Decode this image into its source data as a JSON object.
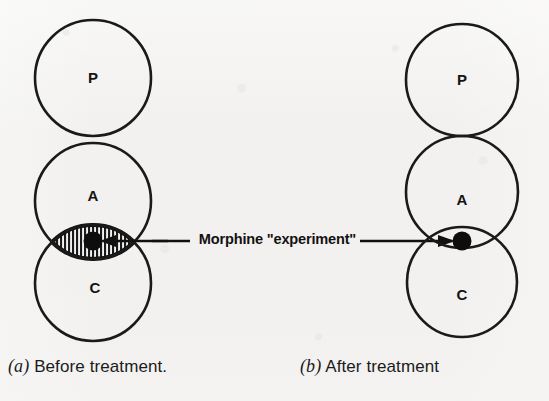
{
  "figure": {
    "center_label": "Morphine \"experiment\"",
    "background_color": "#f2f1ef",
    "ink_color": "#141414"
  },
  "panels": [
    {
      "id": "before",
      "caption_marker": "(a)",
      "caption_text": "Before treatment.",
      "circles": [
        {
          "label": "P",
          "cx": 93,
          "cy": 78,
          "r": 58
        },
        {
          "label": "A",
          "cx": 93,
          "cy": 201,
          "r": 58
        },
        {
          "label": "C",
          "cx": 93,
          "cy": 283,
          "r": 58
        }
      ],
      "overlap": {
        "between": [
          "A",
          "C"
        ],
        "hatched": true,
        "hatch_direction": "vertical",
        "shape": "lens"
      },
      "dot": {
        "cx": 93,
        "cy": 242,
        "r": 9
      },
      "arrow_direction": "left"
    },
    {
      "id": "after",
      "caption_marker": "(b)",
      "caption_text": "After treatment",
      "circles": [
        {
          "label": "P",
          "cx": 462,
          "cy": 80,
          "r": 56
        },
        {
          "label": "A",
          "cx": 462,
          "cy": 192,
          "r": 56
        },
        {
          "label": "C",
          "cx": 462,
          "cy": 282,
          "r": 55
        }
      ],
      "overlap": {
        "between": [
          "A",
          "C"
        ],
        "hatched": false,
        "hatch_direction": "none",
        "shape": "small-lens"
      },
      "dot": {
        "cx": 462,
        "cy": 241,
        "r": 9
      },
      "arrow_direction": "right"
    }
  ],
  "connectors": [
    {
      "name": "left-arrow",
      "from_x": 190,
      "to_x": 104,
      "y": 241,
      "head": "left"
    },
    {
      "name": "right-arrow",
      "from_x": 360,
      "to_x": 452,
      "y": 241,
      "head": "right"
    }
  ],
  "legend_keys": [
    {
      "key": "P",
      "meaning": "P"
    },
    {
      "key": "A",
      "meaning": "A"
    },
    {
      "key": "C",
      "meaning": "C"
    }
  ]
}
